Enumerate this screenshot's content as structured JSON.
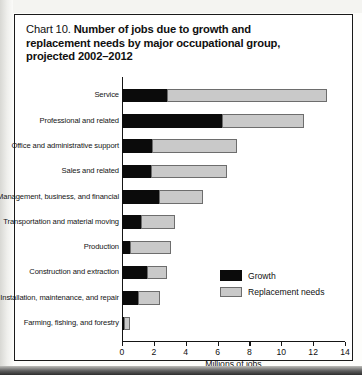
{
  "chart_panel": {
    "title_prefix": "Chart 10.",
    "title_main_line1": "Number of jobs due to growth and",
    "title_main_line2": "replacement needs by major occupational group,",
    "title_main_line3": "projected 2002–2012"
  },
  "legend": {
    "position": "inside-right",
    "entries": [
      {
        "label": "Growth",
        "color": "#0b0b0b"
      },
      {
        "label": "Replacement needs",
        "color": "#c9c9c9"
      }
    ]
  },
  "chart_data": {
    "type": "bar",
    "orientation": "horizontal",
    "stacked": true,
    "title": "Chart 10. Number of jobs due to growth and replacement needs by major occupational group, projected 2002–2012",
    "xlabel": "Millions of jobs",
    "ylabel": "",
    "xlim": [
      0,
      14
    ],
    "xticks": [
      0,
      2,
      4,
      6,
      8,
      10,
      12,
      14
    ],
    "xtick_labels": [
      "0",
      "2",
      "4",
      "6",
      "8",
      "10",
      "12",
      "14"
    ],
    "grid": false,
    "categories": [
      "Service",
      "Professional and related",
      "Office and administrative support",
      "Sales and related",
      "Management, business, and financial",
      "Transportation and material moving",
      "Production",
      "Construction and extraction",
      "Installation, maintenance, and repair",
      "Farming, fishing, and forestry"
    ],
    "series": [
      {
        "name": "Growth",
        "color": "#0b0b0b",
        "values": [
          2.8,
          6.3,
          1.9,
          1.8,
          2.3,
          1.2,
          0.5,
          1.6,
          1.0,
          0.1
        ]
      },
      {
        "name": "Replacement needs",
        "color": "#c9c9c9",
        "values": [
          10.1,
          5.1,
          5.3,
          4.8,
          2.8,
          2.1,
          2.6,
          1.2,
          1.4,
          0.4
        ]
      }
    ],
    "totals": [
      12.9,
      11.4,
      7.2,
      6.6,
      5.1,
      3.3,
      3.1,
      2.8,
      2.4,
      0.5
    ]
  }
}
